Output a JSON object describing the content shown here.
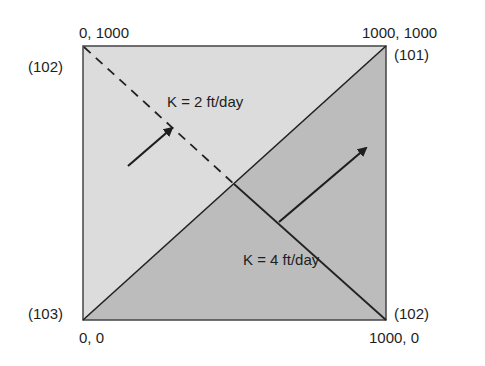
{
  "diagram": {
    "region_upper_left": {
      "label": "K = 2 ft/day",
      "fill": "#dcdcdc"
    },
    "region_lower_right": {
      "label": "K = 4 ft/day",
      "fill": "#bcbcbc"
    },
    "corners": {
      "top_left": {
        "coord": "0, 1000",
        "node": "(102)"
      },
      "top_right": {
        "coord": "1000, 1000",
        "node": "(101)"
      },
      "bottom_left": {
        "coord": "0, 0",
        "node": "(103)"
      },
      "bottom_right": {
        "coord": "1000, 0",
        "node": "(102)"
      }
    },
    "line_color": "#222222"
  }
}
